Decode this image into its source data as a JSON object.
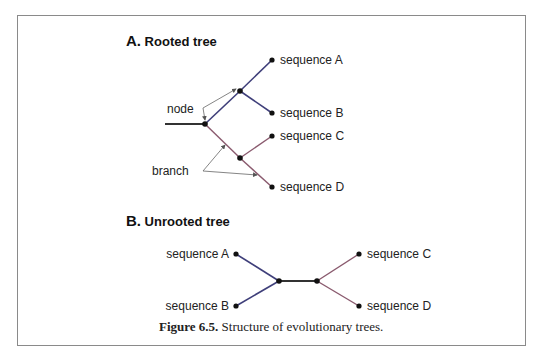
{
  "figure": {
    "caption_label": "Figure 6.5.",
    "caption_text": " Structure of evolutionary trees."
  },
  "panel_a": {
    "letter": "A.",
    "title": " Rooted tree",
    "leaves": [
      "sequence A",
      "sequence B",
      "sequence C",
      "sequence D"
    ],
    "annotations": {
      "node": "node",
      "branch": "branch"
    }
  },
  "panel_b": {
    "letter": "B.",
    "title": " Unrooted tree",
    "leaves": [
      "sequence A",
      "sequence B",
      "sequence C",
      "sequence D"
    ]
  },
  "colors": {
    "blue_branch": "#3f3f7a",
    "red_branch": "#8a5a6e",
    "root_branch": "#333333",
    "node": "#111111",
    "arrow": "#666666",
    "frame": "#8a8a8a"
  }
}
